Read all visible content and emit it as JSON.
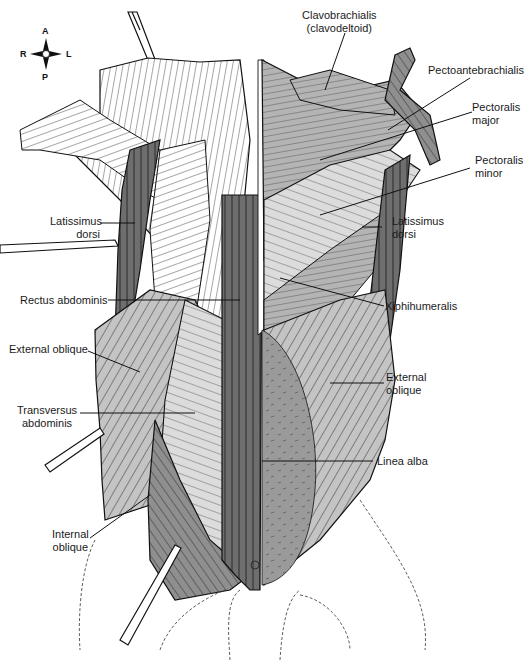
{
  "figure": {
    "orientation": {
      "anterior": "A",
      "posterior": "P",
      "right": "R",
      "left": "L"
    },
    "colors": {
      "background": "#ffffff",
      "ink": "#1a1a1a",
      "dark_muscle": "#6e6e6e",
      "mid_muscle": "#9a9a9a",
      "light_muscle": "#c4c4c4",
      "pale_muscle": "#dcdcdc",
      "white_muscle": "#ffffff"
    },
    "labels": {
      "clavobrachialis": [
        "Clavobrachialis",
        "(clavodeltoid)"
      ],
      "pectoantebrachialis": [
        "Pectoantebrachialis"
      ],
      "pectoralis_major": [
        "Pectoralis",
        "major"
      ],
      "pectoralis_minor": [
        "Pectoralis",
        "minor"
      ],
      "latissimus_dorsi_left": [
        "Latissimus",
        "dorsi"
      ],
      "latissimus_dorsi_right": [
        "Latissimus",
        "dorsi"
      ],
      "rectus_abdominis": [
        "Rectus abdominis"
      ],
      "xiphihumeralis": [
        "Xiphihumeralis"
      ],
      "external_oblique_left": [
        "External oblique"
      ],
      "external_oblique_right": [
        "External",
        "oblique"
      ],
      "transversus_abdominis": [
        "Transversus",
        "abdominis"
      ],
      "linea_alba": [
        "Linea alba"
      ],
      "internal_oblique": [
        "Internal",
        "oblique"
      ]
    }
  }
}
